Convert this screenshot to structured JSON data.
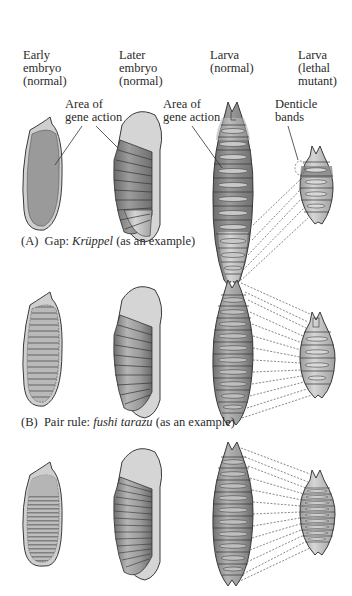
{
  "column_headers": [
    {
      "id": "early-embryo",
      "text": "Early\nembryo\n(normal)"
    },
    {
      "id": "later-embryo",
      "text": "Later\nembryo\n(normal)"
    },
    {
      "id": "larva-normal",
      "text": "Larva\n(normal)"
    },
    {
      "id": "larva-mutant",
      "text": "Larva\n(lethal\nmutant)"
    }
  ],
  "annotations": {
    "area_of_gene_action_1": "Area of\ngene action",
    "area_of_gene_action_2": "Area of\ngene action",
    "denticle_bands": "Denticle\nbands"
  },
  "panels": [
    {
      "letter": "(A)",
      "category": "Gap:",
      "gene": "Krüppel",
      "suffix": "(as an example)"
    },
    {
      "letter": "(B)",
      "category": "Pair rule:",
      "gene": "fushi tarazu",
      "suffix": "(as an example)"
    },
    {
      "letter": "(C)",
      "category": "",
      "gene": "",
      "suffix": ""
    }
  ],
  "colors": {
    "outline": "#3a3a3a",
    "dark_fill": "#8a8a8a",
    "mid_fill": "#a8a8a8",
    "light_fill": "#cfcfcf",
    "background": "#ffffff"
  }
}
